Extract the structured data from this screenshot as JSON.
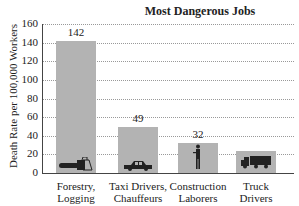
{
  "chart_data": {
    "type": "bar",
    "title": "Most Dangerous Jobs",
    "xlabel": "",
    "ylabel": "Death Rate per 100,000 Workers",
    "ylim": [
      0,
      160
    ],
    "yticks": [
      0,
      20,
      40,
      60,
      80,
      100,
      120,
      140,
      160
    ],
    "grid": true,
    "categories": [
      "Forestry, Logging",
      "Taxi Drivers, Chauffeurs",
      "Construction Laborers",
      "Truck Drivers"
    ],
    "category_lines": [
      [
        "Forestry,",
        "Logging"
      ],
      [
        "Taxi Drivers,",
        "Chauffeurs"
      ],
      [
        "Construction",
        "Laborers"
      ],
      [
        "Truck",
        "Drivers"
      ]
    ],
    "values": [
      142,
      49,
      32,
      24
    ],
    "data_labels": [
      "142",
      "49",
      "32",
      ""
    ],
    "icons": [
      "chainsaw-icon",
      "car-icon",
      "worker-icon",
      "truck-icon"
    ],
    "bar_color": "#b3b3b3"
  }
}
